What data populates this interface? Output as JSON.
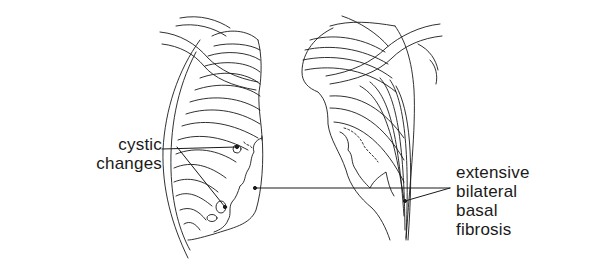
{
  "figure": {
    "type": "anatomical line drawing",
    "colors": {
      "ink": "#1a1a1a",
      "background": "#ffffff"
    }
  },
  "annotations": {
    "left": {
      "lines": [
        "cystic",
        "changes"
      ],
      "targets": 2
    },
    "right": {
      "lines": [
        "extensive",
        "bilateral",
        "basal",
        "fibrosis"
      ],
      "targets": 2
    }
  }
}
